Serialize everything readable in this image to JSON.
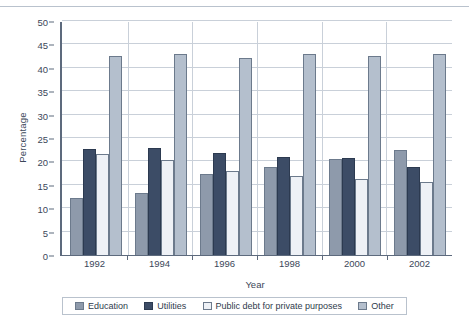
{
  "chart_data": {
    "type": "bar",
    "title": "",
    "subtitle": "",
    "xlabel": "Year",
    "ylabel": "Percentage",
    "categories": [
      "1992",
      "1994",
      "1996",
      "1998",
      "2000",
      "2002"
    ],
    "ylim": [
      0,
      50
    ],
    "ytick_values": [
      0,
      5,
      10,
      15,
      20,
      25,
      30,
      35,
      40,
      45,
      50
    ],
    "ytick_labels": [
      "0",
      "5",
      "10",
      "15",
      "20",
      "25",
      "30",
      "35",
      "40",
      "45",
      "50"
    ],
    "grid": "horizontal",
    "legend_position": "bottom",
    "series": [
      {
        "name": "Education",
        "color": "#8e9aab",
        "values": [
          12.2,
          13.3,
          17.4,
          18.9,
          20.5,
          22.5
        ]
      },
      {
        "name": "Utilities",
        "color": "#3c4c66",
        "values": [
          22.7,
          22.8,
          21.8,
          20.9,
          20.7,
          18.7
        ]
      },
      {
        "name": "Public debt for private purposes",
        "color": "#eef1f6",
        "values": [
          21.5,
          20.2,
          18.0,
          16.8,
          16.3,
          15.5
        ]
      },
      {
        "name": "Other",
        "color": "#b4bfcd",
        "values": [
          42.5,
          43.0,
          42.0,
          43.0,
          42.5,
          43.0
        ]
      }
    ]
  },
  "legend": {
    "items": [
      {
        "label": "Education"
      },
      {
        "label": "Utilities"
      },
      {
        "label": "Public debt for private purposes"
      },
      {
        "label": "Other"
      }
    ]
  }
}
